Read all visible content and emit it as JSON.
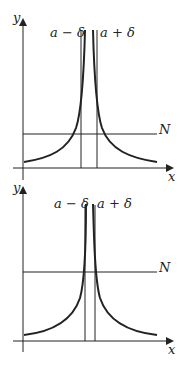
{
  "panels": [
    {
      "id": "top",
      "y_axis_label": "y",
      "x_axis_label": "x",
      "left_line_label": "a − δ",
      "right_line_label": "a + δ",
      "threshold_label": "N"
    },
    {
      "id": "bottom",
      "y_axis_label": "y",
      "x_axis_label": "x",
      "left_line_label": "a − δ",
      "right_line_label": "a + δ",
      "threshold_label": "N"
    }
  ],
  "colors": {
    "stroke": "#222222",
    "background": "#ffffff"
  }
}
